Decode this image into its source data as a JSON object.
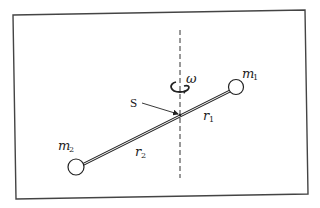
{
  "diagram": {
    "labels": {
      "mass1": {
        "base": "m",
        "sub": "1"
      },
      "mass2": {
        "base": "m",
        "sub": "2"
      },
      "radius1": {
        "base": "r",
        "sub": "1"
      },
      "radius2": {
        "base": "r",
        "sub": "2"
      },
      "pivot": "S",
      "angular_velocity": "ω"
    },
    "elements": {
      "frame": {
        "corners": [
          [
            13,
            15
          ],
          [
            305,
            10
          ],
          [
            308,
            194
          ],
          [
            16,
            199
          ]
        ]
      },
      "axis": {
        "x": 180,
        "y_top": 30,
        "y_bottom": 178,
        "style": "dashed"
      },
      "rod": {
        "from": [
          76,
          167
        ],
        "to": [
          236,
          87
        ]
      },
      "mass1": {
        "cx": 236,
        "cy": 87,
        "r": 7.5
      },
      "mass2": {
        "cx": 76,
        "cy": 167,
        "r": 8
      },
      "pivot_point": {
        "x": 180,
        "y": 115
      }
    },
    "colors": {
      "stroke": "#222222",
      "frame": "#444444",
      "background": "#ffffff"
    }
  }
}
